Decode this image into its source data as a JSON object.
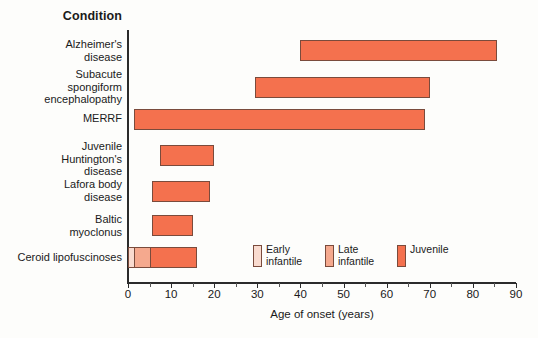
{
  "header": {
    "column_title": "Condition"
  },
  "axis": {
    "x_title": "Age of onset (years)",
    "ticks": [
      0,
      10,
      20,
      30,
      40,
      50,
      60,
      70,
      80,
      90
    ],
    "x_min": 0,
    "x_max": 90
  },
  "legend": {
    "items": [
      {
        "label": "Early infantile",
        "color": "#f9dbcf"
      },
      {
        "label": "Late infantile",
        "color": "#f5a98e"
      },
      {
        "label": "Juvenile",
        "color": "#f4714e"
      }
    ]
  },
  "chart_data": {
    "type": "bar",
    "orientation": "horizontal",
    "title": "",
    "xlabel": "Age of onset (years)",
    "ylabel": "Condition",
    "xlim": [
      0,
      90
    ],
    "grid": false,
    "legend_position": "inside-bottom-right",
    "tick_labels": [
      "0",
      "10",
      "20",
      "30",
      "40",
      "50",
      "60",
      "70",
      "80",
      "90"
    ],
    "categories": [
      "Alzheimer's disease",
      "Subacute spongiform encephalopathy",
      "MERRF",
      "Juvenile Huntington's disease",
      "Lafora body disease",
      "Baltic myoclonus",
      "Ceroid lipofuscinoses"
    ],
    "bars": [
      {
        "category": "Alzheimer's disease",
        "label_lines": [
          "Alzheimer's",
          "disease"
        ],
        "start": 40,
        "end": 85.5,
        "segments": [
          {
            "start": 40,
            "end": 85.5,
            "class": "Juvenile",
            "color": "#f4714e"
          }
        ]
      },
      {
        "category": "Subacute spongiform encephalopathy",
        "label_lines": [
          "Subacute",
          "spongiform",
          "encephalopathy"
        ],
        "start": 29.5,
        "end": 70,
        "segments": [
          {
            "start": 29.5,
            "end": 70,
            "class": "Juvenile",
            "color": "#f4714e"
          }
        ]
      },
      {
        "category": "MERRF",
        "label_lines": [
          "MERRF"
        ],
        "start": 1.5,
        "end": 69,
        "segments": [
          {
            "start": 1.5,
            "end": 69,
            "class": "Juvenile",
            "color": "#f4714e"
          }
        ]
      },
      {
        "category": "Juvenile Huntington's disease",
        "label_lines": [
          "Juvenile",
          "Huntington's",
          "disease"
        ],
        "start": 7.5,
        "end": 20,
        "segments": [
          {
            "start": 7.5,
            "end": 20,
            "class": "Juvenile",
            "color": "#f4714e"
          }
        ]
      },
      {
        "category": "Lafora body disease",
        "label_lines": [
          "Lafora body",
          "disease"
        ],
        "start": 5.5,
        "end": 19,
        "segments": [
          {
            "start": 5.5,
            "end": 19,
            "class": "Juvenile",
            "color": "#f4714e"
          }
        ]
      },
      {
        "category": "Baltic myoclonus",
        "label_lines": [
          "Baltic",
          "myoclonus"
        ],
        "start": 5.5,
        "end": 15,
        "segments": [
          {
            "start": 5.5,
            "end": 15,
            "class": "Juvenile",
            "color": "#f4714e"
          }
        ]
      },
      {
        "category": "Ceroid lipofuscinoses",
        "label_lines": [
          "Ceroid lipofuscinoses"
        ],
        "start": 0,
        "end": 16,
        "segments": [
          {
            "start": 0,
            "end": 1.2,
            "class": "Early infantile",
            "color": "#f9dbcf"
          },
          {
            "start": 1.2,
            "end": 5,
            "class": "Late infantile",
            "color": "#f5a98e"
          },
          {
            "start": 5,
            "end": 16,
            "class": "Juvenile",
            "color": "#f4714e"
          }
        ]
      }
    ]
  },
  "layout": {
    "row_tops": [
      40,
      77,
      109,
      145,
      181,
      215,
      247
    ],
    "label_tops": [
      38,
      68,
      112,
      140,
      178,
      213,
      251
    ]
  }
}
